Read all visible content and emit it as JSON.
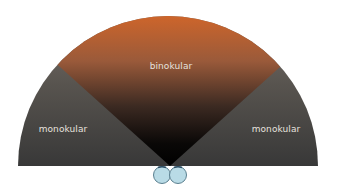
{
  "diagram": {
    "regions": {
      "center": {
        "label": "binokular",
        "color_top": "#c8602a",
        "color_bottom": "#050505"
      },
      "left": {
        "label": "monokular",
        "color_top": "#6e6660",
        "color_bottom": "#3a3a3a"
      },
      "right": {
        "label": "monokular",
        "color_top": "#6e6660",
        "color_bottom": "#3a3a3a"
      }
    },
    "eyes": {
      "count": 2,
      "color": "#b9dbe6",
      "outline": "#5a7f8f"
    }
  }
}
